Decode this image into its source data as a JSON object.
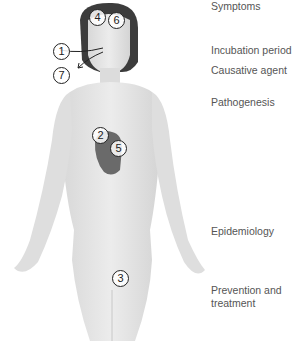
{
  "diagram": {
    "markers": [
      {
        "num": "1",
        "region": "nose"
      },
      {
        "num": "2",
        "region": "heart"
      },
      {
        "num": "3",
        "region": "groin"
      },
      {
        "num": "4",
        "region": "brain"
      },
      {
        "num": "5",
        "region": "heart"
      },
      {
        "num": "6",
        "region": "brain"
      },
      {
        "num": "7",
        "region": "mouth"
      }
    ],
    "labels": [
      "Symptoms",
      "Incubation period",
      "Causative agent",
      "Pathogenesis",
      "Epidemiology",
      "Prevention and",
      "treatment"
    ],
    "colors": {
      "skin": "#e4e4e4",
      "hair": "#3a3a3a",
      "heart": "#6a6a6a",
      "text": "#555555"
    }
  }
}
